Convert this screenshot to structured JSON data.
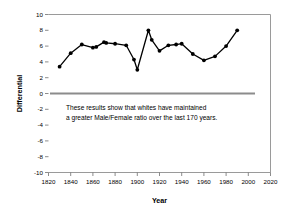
{
  "chart_data": {
    "type": "line",
    "title": "",
    "xlabel": "Year",
    "ylabel": "Differential",
    "xlim": [
      1820,
      2020
    ],
    "ylim": [
      -10,
      10
    ],
    "grid": false,
    "legend": "none",
    "xticks": [
      1820,
      1840,
      1860,
      1880,
      1900,
      1920,
      1940,
      1960,
      1980,
      2000,
      2020
    ],
    "yticks": [
      10,
      8,
      6,
      4,
      2,
      0,
      -2,
      -4,
      -6,
      -8,
      -10
    ],
    "zero_reference_line": 0,
    "annotations": [
      "These results show that whites have maintained",
      "a greater Male/Female ratio over the last 170 years."
    ],
    "series": [
      {
        "name": "Differential",
        "marker": "filled-circle",
        "color": "#000000",
        "x": [
          1830,
          1840,
          1850,
          1860,
          1863,
          1870,
          1872,
          1880,
          1890,
          1897,
          1900,
          1910,
          1913,
          1920,
          1928,
          1935,
          1940,
          1950,
          1960,
          1970,
          1980,
          1990
        ],
        "values": [
          3.4,
          5.1,
          6.2,
          5.8,
          5.9,
          6.5,
          6.4,
          6.3,
          6.1,
          4.3,
          3.0,
          8.0,
          6.8,
          5.4,
          6.1,
          6.2,
          6.3,
          5.0,
          4.2,
          4.7,
          6.0,
          8.0
        ]
      }
    ]
  },
  "axis": {
    "x_title": "Year",
    "y_title": "Differential",
    "x_tick_labels": [
      "1820",
      "1840",
      "1860",
      "1880",
      "1900",
      "1920",
      "1940",
      "1960",
      "1980",
      "2000",
      "2020"
    ],
    "y_tick_labels": [
      "10",
      "8",
      "6",
      "4",
      "2",
      "0",
      "-2",
      "-4",
      "-6",
      "-8",
      "-10"
    ]
  },
  "annotation": {
    "line1": "These results show that whites have maintained",
    "line2": "a greater Male/Female ratio over the last 170 years."
  },
  "colors": {
    "series": "#000000",
    "frame": "#9a9a9a",
    "zero_line": "#8c8c8c",
    "background": "#ffffff"
  }
}
